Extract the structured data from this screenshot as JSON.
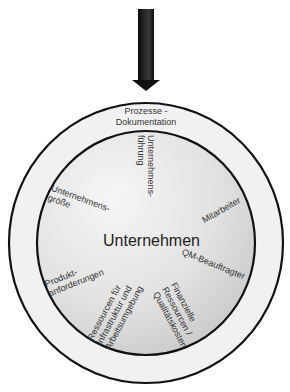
{
  "diagram": {
    "arrow": {
      "direction": "down",
      "color": "#1a1a1a"
    },
    "outer_ring": {
      "label_lines": [
        "Prozesse -",
        "Dokumentation"
      ],
      "fill": "#f2f2f2",
      "stroke": "#111111"
    },
    "inner_circle": {
      "center_label": "Unternehmen",
      "fill_light": "#f4f4f4",
      "fill_dark": "#c9c9c9",
      "stroke": "#111111",
      "factors": [
        {
          "id": "unternehmensfuehrung",
          "lines": [
            "Unternehmens-",
            "führung"
          ]
        },
        {
          "id": "mitarbeiter",
          "lines": [
            "Mitarbeiter"
          ]
        },
        {
          "id": "qm-beauftragter",
          "lines": [
            "QM-Beauftragter"
          ]
        },
        {
          "id": "finanzielle-ressourcen",
          "lines": [
            "Finanzielle",
            "Ressourcen /",
            "Qualitätskosten"
          ]
        },
        {
          "id": "ressourcen-infrastruktur",
          "lines": [
            "Ressourcen für",
            "Infrastruktur und",
            "Arbeitsumgebung"
          ]
        },
        {
          "id": "produktanforderungen",
          "lines": [
            "Produkt-",
            "anforderungen"
          ]
        },
        {
          "id": "unternehmensgroesse",
          "lines": [
            "Unternehmens-",
            "größe"
          ]
        }
      ]
    }
  }
}
